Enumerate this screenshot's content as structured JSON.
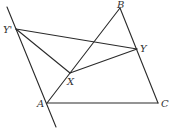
{
  "diagram": {
    "points": {
      "A": {
        "label": "A",
        "x": 47,
        "y": 103
      },
      "B": {
        "label": "B",
        "x": 120,
        "y": 8
      },
      "C": {
        "label": "C",
        "x": 158,
        "y": 103
      },
      "X": {
        "label": "X",
        "x": 70,
        "y": 73
      },
      "Y": {
        "label": "Y",
        "x": 137,
        "y": 49
      },
      "Yp": {
        "label": "Y'",
        "x": 16,
        "y": 29
      }
    },
    "line_through": {
      "from": "Y'",
      "to": "A",
      "extended": true
    },
    "segments": [
      "AB",
      "BC",
      "CA",
      "Y'Y",
      "Y'X",
      "XY"
    ],
    "colors": {
      "stroke": "#2a2a2a",
      "label": "#333333",
      "background": "#ffffff"
    }
  }
}
